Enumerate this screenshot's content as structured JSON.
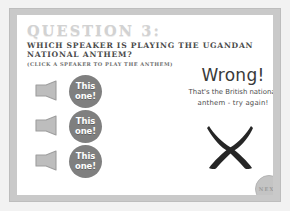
{
  "slide": {
    "title": "QUESTION 3:",
    "prompt": "WHICH SPEAKER IS PLAYING THE UGANDAN NATIONAL ANTHEM?",
    "hint": "(CLICK A SPEAKER TO PLAY THE ANTHEM)",
    "colors": {
      "page_background": "#f2f2f2",
      "frame": "#c9c9c9",
      "slide_background": "#ffffff",
      "title_text": "#d2d2d2",
      "prompt_text": "#4a4a4a",
      "button_fill": "#7f7f7f",
      "button_text": "#ffffff",
      "cross_mark": "#262626",
      "next_fill": "#c4c4c4"
    }
  },
  "answers": [
    {
      "speaker_icon": "speaker-icon",
      "button_line1": "This",
      "button_line2": "one!"
    },
    {
      "speaker_icon": "speaker-icon",
      "button_line1": "This",
      "button_line2": "one!"
    },
    {
      "speaker_icon": "speaker-icon",
      "button_line1": "This",
      "button_line2": "one!"
    }
  ],
  "feedback": {
    "headline": "Wrong!",
    "detail_line1": "That's the British national",
    "detail_line2": "anthem - try again!",
    "mark_icon": "cross-mark-icon"
  },
  "next": {
    "label": "NEXT"
  }
}
